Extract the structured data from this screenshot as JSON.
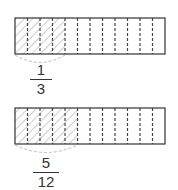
{
  "diagram": {
    "sections_per_bar": 12,
    "colors": {
      "stroke": "#333333",
      "hatch": "#9a9a9a",
      "brace": "#bbbbbb",
      "divider": "#444444"
    },
    "bars": [
      {
        "id": "top",
        "shaded_sections": 4,
        "label": {
          "numerator": "1",
          "denominator": "3"
        }
      },
      {
        "id": "bottom",
        "shaded_sections": 5,
        "label": {
          "numerator": "5",
          "denominator": "12"
        }
      }
    ]
  }
}
